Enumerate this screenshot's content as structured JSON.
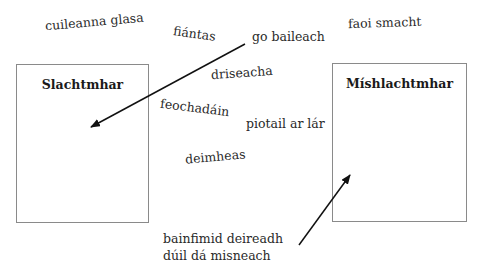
{
  "boxes": [
    {
      "id": "left",
      "title": "Slachtmhar"
    },
    {
      "id": "right",
      "title": "Míshlachtmhar"
    }
  ],
  "words": [
    {
      "text": "cuileanna glasa"
    },
    {
      "text": "fiántas"
    },
    {
      "text": "go baileach"
    },
    {
      "text": "faoi smacht"
    },
    {
      "text": "driseacha"
    },
    {
      "text": "feochadáin"
    },
    {
      "text": "piotail ar lár"
    },
    {
      "text": "deimheas"
    }
  ],
  "bottom_phrase": {
    "line1": "bainfimid deireadh",
    "line2": "dúil dá misneach"
  },
  "arrows": [
    {
      "from": "go baileach",
      "to": "Slachtmhar"
    },
    {
      "from": "bainfimid deireadh / dúil dá misneach",
      "to": "Míshlachtmhar"
    }
  ]
}
